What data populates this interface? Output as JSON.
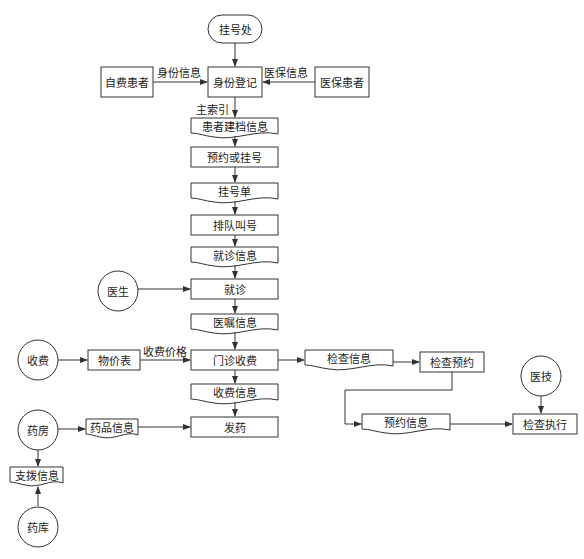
{
  "diagram": {
    "type": "flowchart",
    "nodes": {
      "registration_office": {
        "label": "挂号处",
        "shape": "terminator"
      },
      "self_pay_patient": {
        "label": "自费患者",
        "shape": "process"
      },
      "insured_patient": {
        "label": "医保患者",
        "shape": "process"
      },
      "identity_registration": {
        "label": "身份登记",
        "shape": "process"
      },
      "patient_record_info": {
        "label": "患者建档信息",
        "shape": "document"
      },
      "appointment_or_register": {
        "label": "预约或挂号",
        "shape": "process"
      },
      "registration_slip": {
        "label": "挂号单",
        "shape": "document"
      },
      "queue_calling": {
        "label": "排队叫号",
        "shape": "process"
      },
      "visit_info": {
        "label": "就诊信息",
        "shape": "document"
      },
      "doctor": {
        "label": "医生",
        "shape": "circle"
      },
      "consultation": {
        "label": "就诊",
        "shape": "process"
      },
      "medical_order_info": {
        "label": "医嘱信息",
        "shape": "document"
      },
      "cashier": {
        "label": "收费",
        "shape": "circle"
      },
      "price_list": {
        "label": "物价表",
        "shape": "process"
      },
      "outpatient_billing": {
        "label": "门诊收费",
        "shape": "process"
      },
      "exam_info": {
        "label": "检查信息",
        "shape": "document"
      },
      "exam_appointment": {
        "label": "检查预约",
        "shape": "process"
      },
      "billing_info": {
        "label": "收费信息",
        "shape": "document"
      },
      "appointment_info": {
        "label": "预约信息",
        "shape": "document"
      },
      "medical_technician": {
        "label": "医技",
        "shape": "circle"
      },
      "exam_execution": {
        "label": "检查执行",
        "shape": "process"
      },
      "pharmacy": {
        "label": "药房",
        "shape": "circle"
      },
      "drug_info": {
        "label": "药品信息",
        "shape": "document"
      },
      "dispense": {
        "label": "发药",
        "shape": "process"
      },
      "transfer_info": {
        "label": "支拨信息",
        "shape": "document"
      },
      "drug_warehouse": {
        "label": "药库",
        "shape": "circle"
      }
    },
    "edge_labels": {
      "identity_info": "身份信息",
      "insurance_info": "医保信息",
      "master_index": "主索引",
      "fee_price": "收费价格"
    }
  }
}
